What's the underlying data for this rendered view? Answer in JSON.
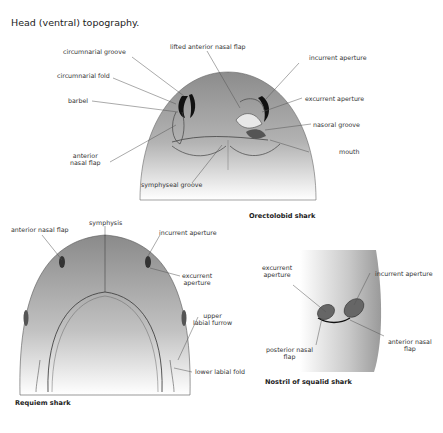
{
  "title": "Head (ventral) topography.",
  "orectolobid": {
    "caption": "Orectolobid shark",
    "labels": {
      "circumnarial_groove": "circumnarial groove",
      "circumnarial_fold": "circumnarial fold",
      "barbel": "barbel",
      "anterior_nasal_flap_1": "anterior",
      "anterior_nasal_flap_2": "nasal flap",
      "lifted_anterior_nasal_flap": "lifted anterior nasal flap",
      "incurrent_aperture": "incurrent aperture",
      "excurrent_aperture": "excurrent aperture",
      "nasoral_groove": "nasoral groove",
      "mouth": "mouth",
      "symphyseal_groove": "symphyseal groove"
    }
  },
  "requiem": {
    "caption": "Requiem shark",
    "labels": {
      "anterior_nasal_flap": "anterior nasal flap",
      "symphysis": "symphysis",
      "incurrent_aperture": "incurrent aperture",
      "excurrent_aperture_1": "excurrent",
      "excurrent_aperture_2": "aperture",
      "upper_labial_furrow_1": "upper",
      "upper_labial_furrow_2": "labial furrow",
      "lower_labial_fold": "lower labial fold"
    }
  },
  "squalid": {
    "caption": "Nostril of squalid shark",
    "labels": {
      "excurrent_aperture_1": "excurrent",
      "excurrent_aperture_2": "aperture",
      "incurrent_aperture": "incurrent aperture",
      "posterior_nasal_flap_1": "posterior nasal",
      "posterior_nasal_flap_2": "flap",
      "anterior_nasal_flap_1": "anterior nasal",
      "anterior_nasal_flap_2": "flap"
    }
  },
  "colors": {
    "skin_dark": "#8e8e8e",
    "skin_light": "#ffffff",
    "nostril": "#111111",
    "line": "#555555"
  }
}
